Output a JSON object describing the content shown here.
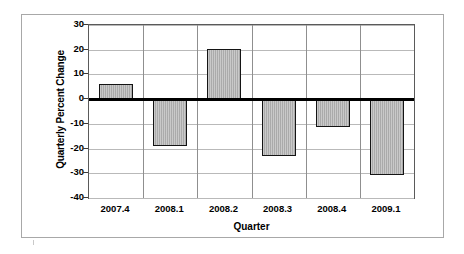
{
  "chart_data": {
    "type": "bar",
    "title": "",
    "xlabel": "Quarter",
    "ylabel": "Quarterly Percent Change",
    "categories": [
      "2007.4",
      "2008.1",
      "2008.2",
      "2008.3",
      "2008.4",
      "2009.1"
    ],
    "values": [
      6.0,
      -19.0,
      20.3,
      -23.0,
      -11.3,
      -30.5
    ],
    "ylim": [
      -40,
      30
    ],
    "ytick_labels": [
      "30",
      "20",
      "10",
      "0",
      "-10",
      "-20",
      "-30",
      "-40"
    ],
    "ytick_values": [
      30,
      20,
      10,
      0,
      -10,
      -20,
      -30,
      -40
    ],
    "grid": true,
    "legend": "none",
    "bar_fill_color": "#b2b2b2",
    "bar_edge_color": "#141414",
    "gridline_color": "#b9b9b9",
    "zero_line_color": "#000000",
    "plot_background": "#ffffff"
  }
}
